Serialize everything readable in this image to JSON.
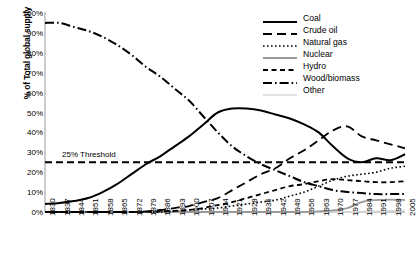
{
  "chart_data": {
    "type": "line",
    "title": "",
    "xlabel": "",
    "ylabel": "% of Total global supply",
    "ylim": [
      0,
      100
    ],
    "ytick_labels": [
      "100%",
      "90%",
      "80%",
      "70%",
      "60%",
      "50%",
      "40%",
      "30%",
      "20%",
      "10%",
      "0%"
    ],
    "ytick_values": [
      100,
      90,
      80,
      70,
      60,
      50,
      40,
      30,
      20,
      10,
      0
    ],
    "grid": false,
    "legend_position": "top-right",
    "x": [
      1830,
      1837,
      1844,
      1851,
      1858,
      1865,
      1872,
      1879,
      1886,
      1893,
      1900,
      1907,
      1914,
      1921,
      1928,
      1935,
      1942,
      1949,
      1956,
      1963,
      1970,
      1977,
      1984,
      1991,
      1998,
      2005
    ],
    "xtick_labels": [
      "1830",
      "1837",
      "1844",
      "1851",
      "1858",
      "1865",
      "1872",
      "1879",
      "1886",
      "1893",
      "1900",
      "1907",
      "1914",
      "1921",
      "1928",
      "1935",
      "1942",
      "1949",
      "1956",
      "1963",
      "1970",
      "1977",
      "1984",
      "1991",
      "1998",
      "2005"
    ],
    "series": [
      {
        "name": "Coal",
        "style": "solid",
        "color": "#000000",
        "width": 2.0,
        "values": [
          4,
          4.5,
          5.5,
          7,
          10,
          14,
          19,
          24,
          28,
          33,
          38,
          44,
          50,
          52,
          52,
          51,
          49,
          47,
          44,
          40,
          33,
          27,
          25,
          27,
          26,
          29
        ]
      },
      {
        "name": "Crude oil",
        "style": "longdash",
        "color": "#000000",
        "width": 1.8,
        "values": [
          0,
          0,
          0,
          0,
          0,
          0,
          0,
          0.3,
          1,
          2,
          3,
          5,
          7,
          11,
          15,
          19,
          22,
          27,
          31,
          36,
          41,
          43,
          38,
          36,
          34,
          32
        ]
      },
      {
        "name": "Natural gas",
        "style": "dotted",
        "color": "#000000",
        "width": 1.6,
        "values": [
          0,
          0,
          0,
          0,
          0,
          0,
          0,
          0,
          0,
          0.5,
          1,
          1.5,
          2,
          3,
          4,
          5,
          6,
          8,
          10,
          13,
          16,
          18,
          19,
          20,
          22,
          23
        ]
      },
      {
        "name": "Nuclear",
        "style": "solid",
        "color": "#9a9a9a",
        "width": 1.8,
        "values": [
          0,
          0,
          0,
          0,
          0,
          0,
          0,
          0,
          0,
          0,
          0,
          0,
          0,
          0,
          0,
          0,
          0,
          0,
          0,
          0.3,
          0.8,
          2,
          5,
          6,
          6.2,
          6
        ]
      },
      {
        "name": "Hydro",
        "style": "shortdash",
        "color": "#000000",
        "width": 1.8,
        "values": [
          0,
          0,
          0,
          0,
          0,
          0,
          0,
          0,
          0.3,
          0.6,
          1,
          2,
          3.5,
          5,
          7,
          9,
          11,
          13,
          14,
          15.5,
          16.5,
          16,
          15.5,
          15,
          15,
          15.5
        ]
      },
      {
        "name": "Wood/biomass",
        "style": "dashdot",
        "color": "#000000",
        "width": 2.0,
        "values": [
          95,
          95,
          93,
          91,
          88,
          84,
          79,
          73,
          68,
          62,
          56,
          48,
          40,
          33,
          28,
          24,
          21,
          18,
          15,
          13,
          11,
          10,
          9.5,
          9,
          9,
          9
        ]
      },
      {
        "name": "Other",
        "style": "solid",
        "color": "#d9d9d9",
        "width": 1.4,
        "values": [
          0,
          0,
          0,
          0,
          0,
          0,
          0,
          0,
          0,
          0,
          0,
          0,
          0,
          0,
          0,
          0,
          0,
          0,
          0,
          0,
          0,
          0,
          0.2,
          0.4,
          0.6,
          0.8
        ]
      }
    ],
    "annotations": [
      {
        "name": "threshold",
        "label": "25% Threshold",
        "value": 25,
        "style": "dashed",
        "color": "#000000"
      }
    ]
  },
  "legend": {
    "items": [
      {
        "label": "Coal"
      },
      {
        "label": "Crude oil"
      },
      {
        "label": "Natural gas"
      },
      {
        "label": "Nuclear"
      },
      {
        "label": "Hydro"
      },
      {
        "label": "Wood/biomass"
      },
      {
        "label": "Other"
      }
    ]
  }
}
